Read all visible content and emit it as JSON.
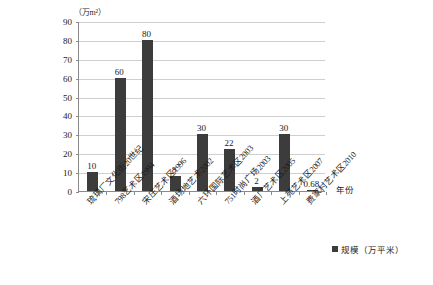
{
  "chart_data": {
    "type": "bar",
    "title": "",
    "subtitle": "",
    "xlabel": "年份",
    "ylabel": "（万m²）",
    "ylim": [
      0,
      90
    ],
    "ytick_step": 10,
    "yticks": [
      0,
      10,
      20,
      30,
      40,
      50,
      60,
      70,
      80,
      90
    ],
    "grid": true,
    "legend_position": "bottom-right",
    "categories": [
      "琉璃厂文化街20世纪",
      "798艺术区1994",
      "宋庄艺术区1996",
      "酒场地艺术2002",
      "六环国际艺术区2003",
      "751时尚广场2003",
      "酒厂艺术区2005",
      "上苑艺术区2007",
      "费家村艺术区2010"
    ],
    "series": [
      {
        "name": "规模（万平米）",
        "values": [
          10,
          60,
          80,
          8,
          30,
          22,
          2,
          30,
          0.68
        ],
        "color": "#3c3c3c"
      }
    ],
    "data_labels": [
      "10",
      "60",
      "80",
      "8",
      "30",
      "22",
      "2",
      "30",
      "0.68"
    ]
  },
  "axis": {
    "y_unit_caption": "（万m²）",
    "x_title": "年份"
  },
  "legend": {
    "entries": [
      {
        "label": "规模（万平米）",
        "color": "#3c3c3c"
      }
    ]
  }
}
